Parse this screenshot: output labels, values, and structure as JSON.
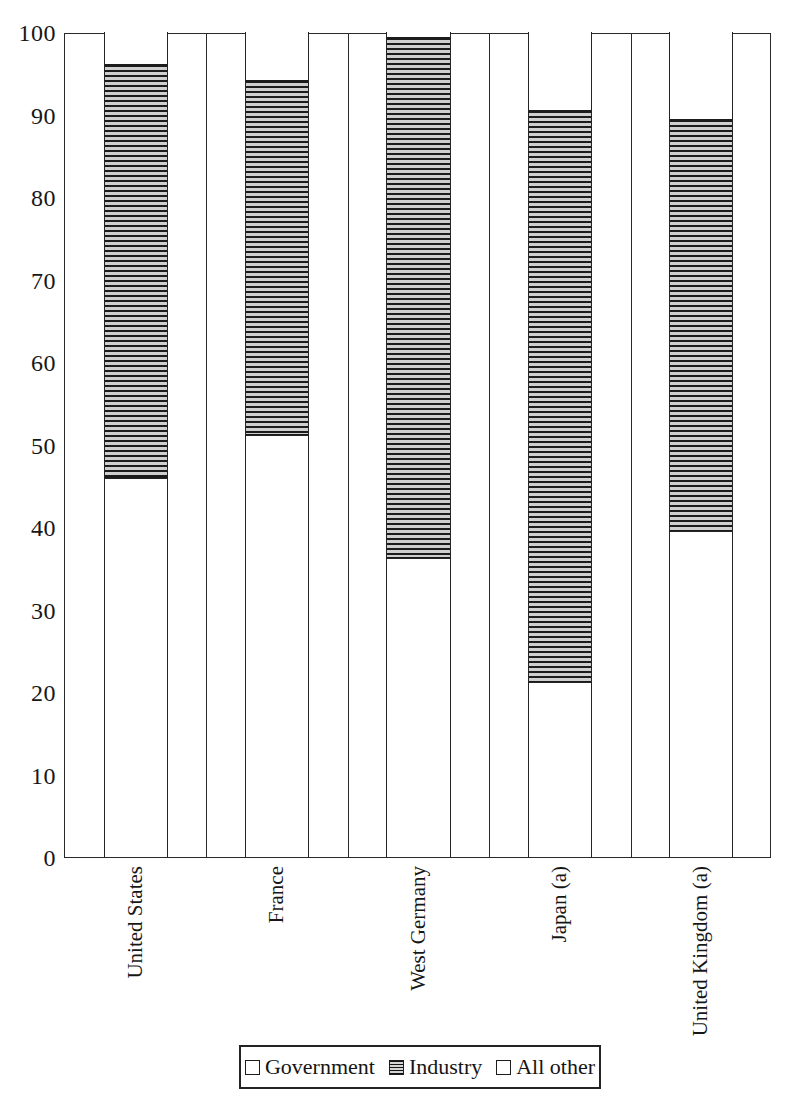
{
  "chart_data": {
    "type": "bar",
    "subtype": "stacked-vertical-100",
    "title": "",
    "subtitle": "",
    "xlabel": "",
    "ylabel": "",
    "ylim": [
      0,
      100
    ],
    "yticks": [
      0,
      10,
      20,
      30,
      40,
      50,
      60,
      70,
      80,
      90,
      100
    ],
    "ytick_labels": [
      "0",
      "10",
      "20",
      "30",
      "40",
      "50",
      "60",
      "70",
      "80",
      "90",
      "100"
    ],
    "grid": false,
    "legend_position": "bottom-center",
    "categories": [
      "United States",
      "France",
      "West Germany",
      "Japan (a)",
      "United Kingdom (a)"
    ],
    "series": [
      {
        "name": "Government",
        "fill": "open-white",
        "values": [
          46.0,
          51.2,
          36.2,
          21.2,
          39.5
        ]
      },
      {
        "name": "Industry",
        "fill": "horizontal-hatch",
        "values": [
          50.1,
          43.0,
          63.2,
          69.4,
          50.0
        ]
      },
      {
        "name": "All other",
        "fill": "open-white",
        "values": [
          3.9,
          5.8,
          0.6,
          9.4,
          10.5
        ]
      }
    ],
    "cumulative_tops": {
      "government": [
        46.0,
        51.2,
        36.2,
        21.2,
        39.5
      ],
      "industry": [
        96.1,
        94.2,
        99.4,
        90.6,
        89.5
      ],
      "all_other": [
        100,
        100,
        100,
        100,
        100
      ]
    }
  },
  "legend": {
    "entries": [
      {
        "label": "Government",
        "swatch": "open-square-icon"
      },
      {
        "label": "Industry",
        "swatch": "hatched-square-icon"
      },
      {
        "label": "All other",
        "swatch": "open-square-icon"
      }
    ]
  }
}
